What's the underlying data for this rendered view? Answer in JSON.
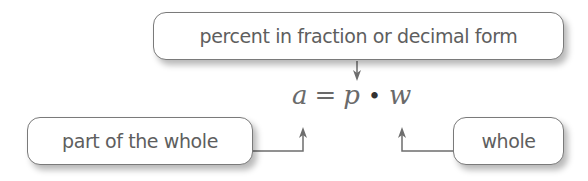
{
  "diagram": {
    "labels": {
      "percent": "percent in fraction or decimal form",
      "part": "part of the whole",
      "whole": "whole"
    },
    "equation": {
      "lhs": "a",
      "equals": "=",
      "p": "p",
      "times": "•",
      "w": "w"
    },
    "colors": {
      "text": "#5e5e5e",
      "border": "#7a7a7a",
      "arrow": "#6e6e6e"
    }
  }
}
